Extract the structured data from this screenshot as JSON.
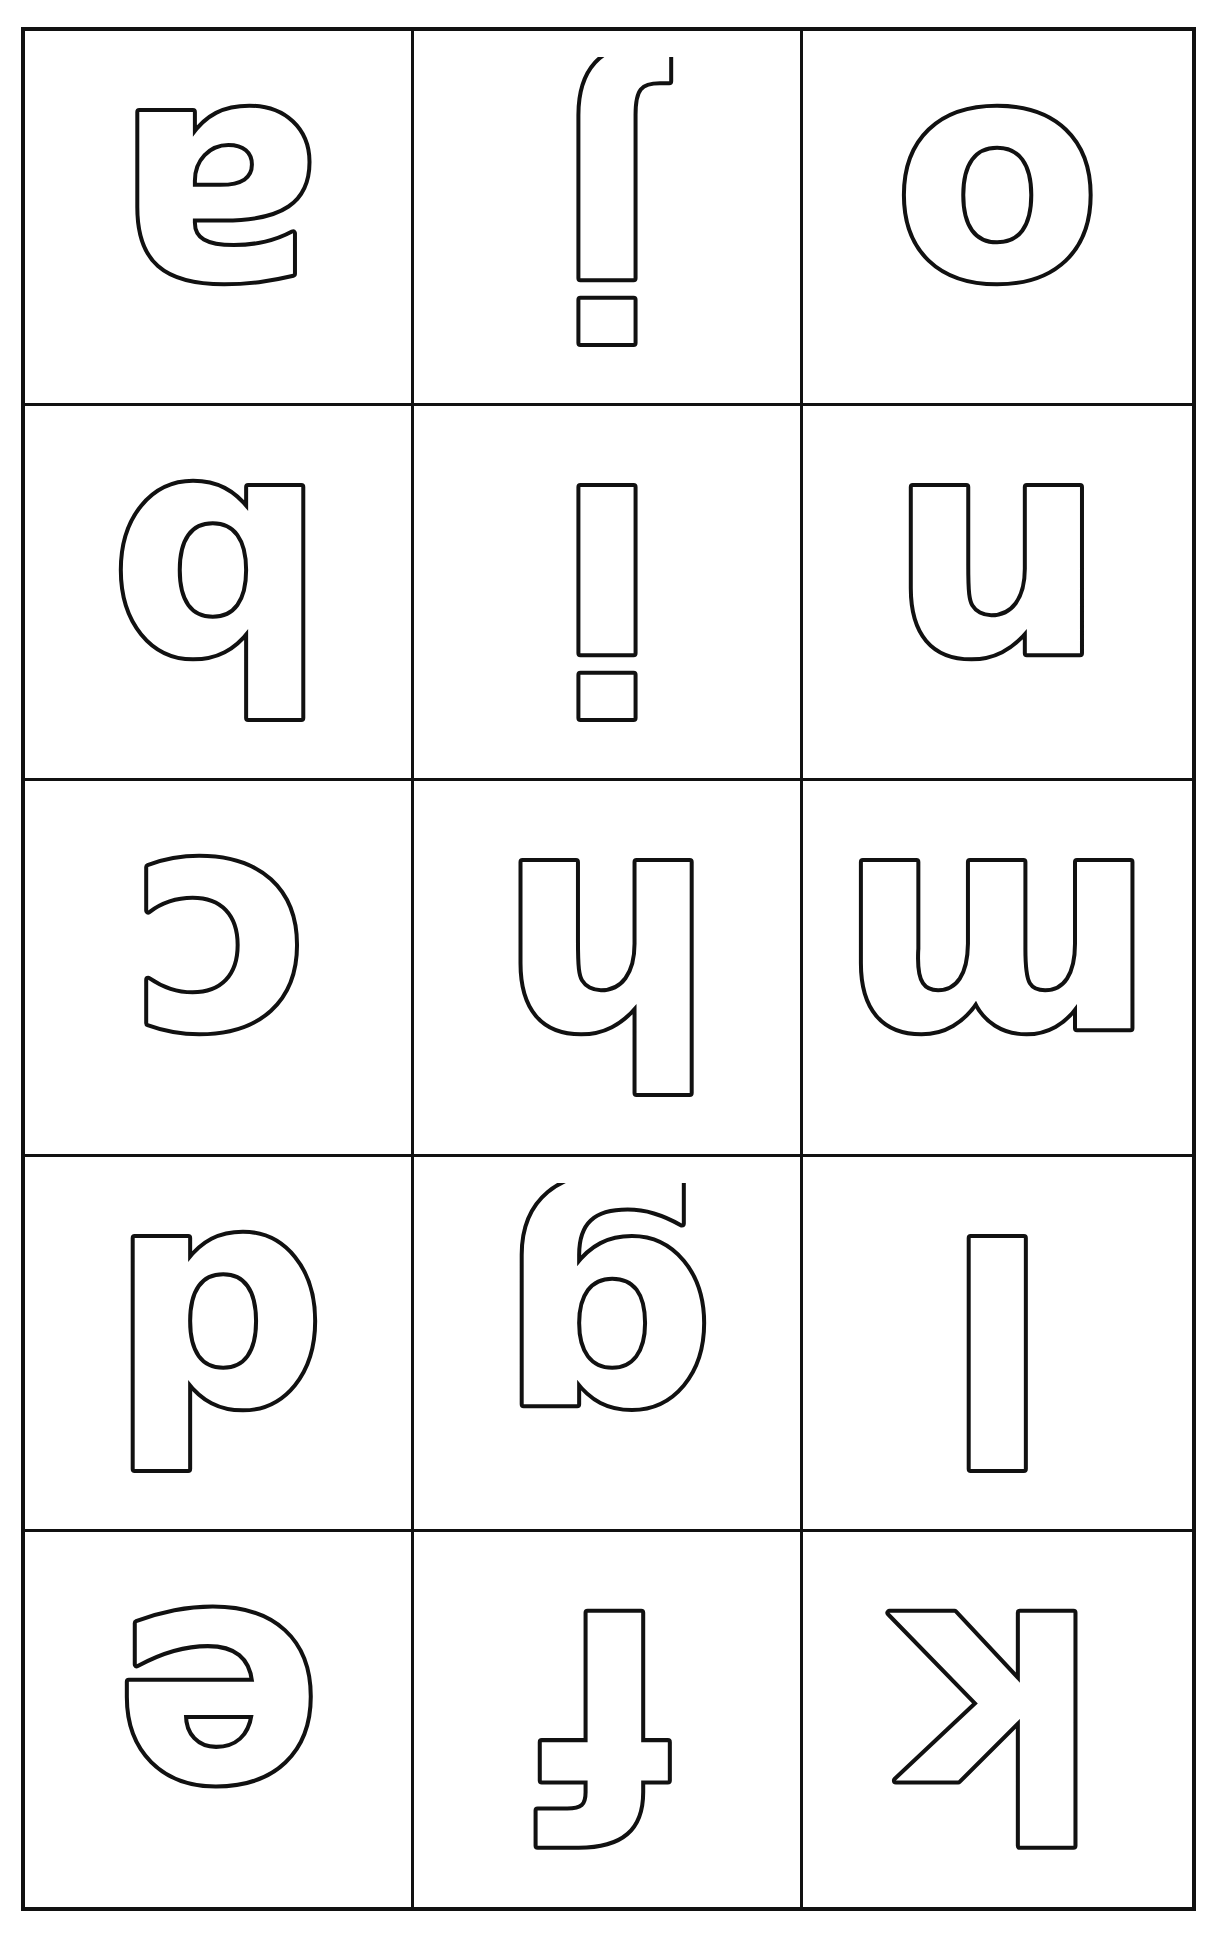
{
  "page": {
    "background_color": "#ffffff",
    "ink_color": "#111111",
    "border_color": "#111111",
    "columns": 3,
    "rows": 5,
    "style": "hollow outline letters, rotated 180 degrees"
  },
  "cells": [
    {
      "id": "r1c1",
      "letter": "a",
      "rotation": 180,
      "name": "letter-a-rotated"
    },
    {
      "id": "r1c2",
      "letter": "j",
      "rotation": 180,
      "name": "letter-j-rotated"
    },
    {
      "id": "r1c3",
      "letter": "o",
      "rotation": 180,
      "name": "letter-o-rotated"
    },
    {
      "id": "r2c1",
      "letter": "b",
      "rotation": 180,
      "name": "letter-b-rotated"
    },
    {
      "id": "r2c2",
      "letter": "i",
      "rotation": 180,
      "name": "letter-i-rotated"
    },
    {
      "id": "r2c3",
      "letter": "n",
      "rotation": 180,
      "name": "letter-n-rotated"
    },
    {
      "id": "r3c1",
      "letter": "c",
      "rotation": 180,
      "name": "letter-c-rotated"
    },
    {
      "id": "r3c2",
      "letter": "h",
      "rotation": 180,
      "name": "letter-h-rotated"
    },
    {
      "id": "r3c3",
      "letter": "m",
      "rotation": 180,
      "name": "letter-m-rotated"
    },
    {
      "id": "r4c1",
      "letter": "d",
      "rotation": 180,
      "name": "letter-d-rotated"
    },
    {
      "id": "r4c2",
      "letter": "g",
      "rotation": 180,
      "name": "letter-g-rotated"
    },
    {
      "id": "r4c3",
      "letter": "l",
      "rotation": 180,
      "name": "letter-l-rotated"
    },
    {
      "id": "r5c1",
      "letter": "e",
      "rotation": 180,
      "name": "letter-e-rotated"
    },
    {
      "id": "r5c2",
      "letter": "f",
      "rotation": 180,
      "name": "letter-f-rotated"
    },
    {
      "id": "r5c3",
      "letter": "k",
      "rotation": 180,
      "name": "letter-k-rotated"
    }
  ]
}
